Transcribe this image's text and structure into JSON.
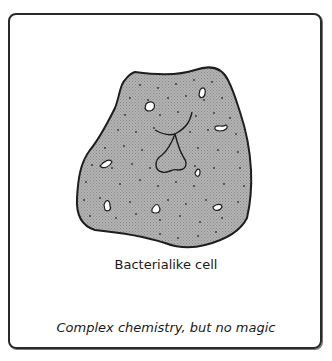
{
  "figure": {
    "label": "Bacterialike cell",
    "caption": "Complex chemistry, but no magic",
    "colors": {
      "cell_fill": "#a8a8a8",
      "outline": "#1e1e1e",
      "frame": "#2a2a2a",
      "vacuole_fill": "#ffffff"
    }
  }
}
